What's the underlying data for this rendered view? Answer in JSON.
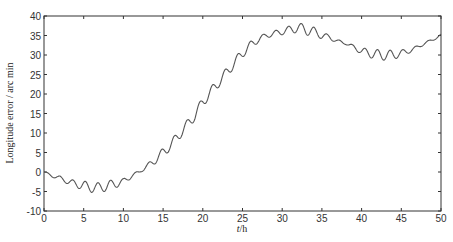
{
  "chart_data": {
    "type": "line",
    "title": "",
    "xlabel": "t/h",
    "xlabel_italic_part": "t",
    "xlabel_rest": "/h",
    "ylabel": "Longitude error / arc min",
    "xlim": [
      0,
      50
    ],
    "ylim": [
      -10,
      40
    ],
    "x_ticks": [
      0,
      5,
      10,
      15,
      20,
      25,
      30,
      35,
      40,
      45,
      50
    ],
    "y_ticks": [
      -10,
      -5,
      0,
      5,
      10,
      15,
      20,
      25,
      30,
      35,
      40
    ],
    "grid": false,
    "legend": null,
    "line_color": "#555555",
    "series": [
      {
        "name": "Longitude error",
        "trend": {
          "x": [
            0,
            1,
            2,
            3,
            4,
            5,
            6,
            7,
            8,
            9,
            10,
            11,
            12,
            13,
            14,
            15,
            16,
            17,
            18,
            19,
            20,
            21,
            22,
            23,
            24,
            25,
            26,
            27,
            28,
            29,
            30,
            31,
            32,
            33,
            34,
            35,
            36,
            37,
            38,
            39,
            40,
            41,
            42,
            43,
            44,
            45,
            46,
            47,
            48,
            49,
            50
          ],
          "y": [
            0,
            -1,
            -1.5,
            -2.5,
            -3,
            -3.5,
            -4,
            -4,
            -3.5,
            -3,
            -2.5,
            -1,
            0,
            1.5,
            3,
            5,
            7,
            9.5,
            12,
            14.5,
            18,
            20.5,
            23,
            25.5,
            28,
            30.5,
            32.5,
            34,
            35,
            35.5,
            36,
            36.5,
            37,
            36.5,
            36,
            35,
            34.5,
            33.5,
            33,
            32,
            31,
            30.5,
            30,
            30,
            30,
            30.5,
            31,
            32,
            33,
            34,
            35
          ]
        },
        "oscillation": {
          "period_h": 1.6,
          "amplitude_profile": {
            "x": [
              0,
              3,
              5,
              8,
              10,
              12,
              15,
              20,
              25,
              28,
              30,
              33,
              36,
              38,
              40,
              42,
              44,
              46,
              48,
              50
            ],
            "amp": [
              0.2,
              0.6,
              1.2,
              1.3,
              0.8,
              0.3,
              1.2,
              1.3,
              1.2,
              0.6,
              0.8,
              1.4,
              0.6,
              0.3,
              0.8,
              1.4,
              1.2,
              0.5,
              0.3,
              0.3
            ]
          }
        }
      }
    ]
  }
}
